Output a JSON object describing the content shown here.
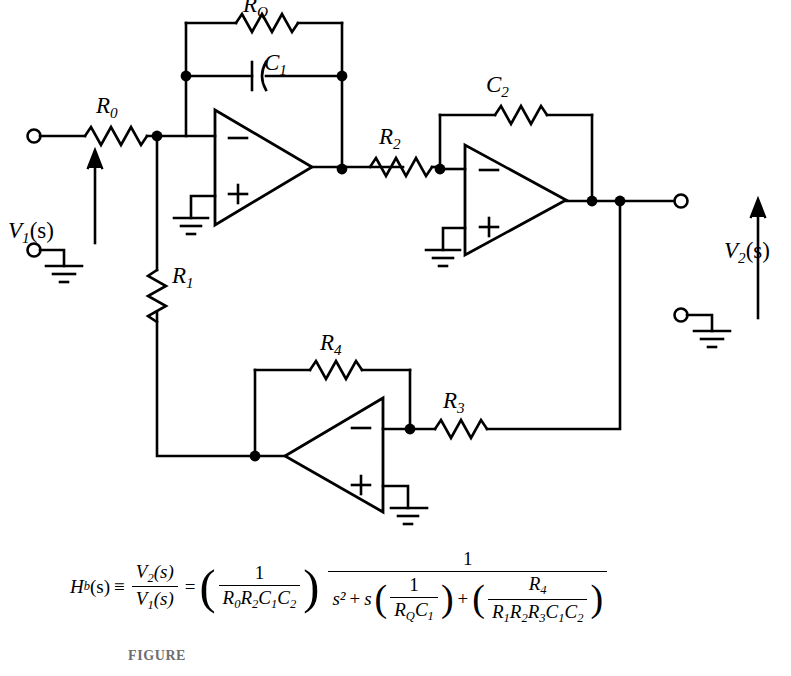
{
  "figure": {
    "type": "circuit-schematic",
    "caption": "FIGURE"
  },
  "labels": {
    "RQ": {
      "base": "R",
      "sub": "Q",
      "text": "RQ"
    },
    "C1": {
      "base": "C",
      "sub": "1",
      "text": "C1"
    },
    "R0": {
      "base": "R",
      "sub": "0",
      "text": "R0"
    },
    "R1": {
      "base": "R",
      "sub": "1",
      "text": "R1"
    },
    "R2": {
      "base": "R",
      "sub": "2",
      "text": "R2"
    },
    "R3": {
      "base": "R",
      "sub": "3",
      "text": "R3"
    },
    "R4": {
      "base": "R",
      "sub": "4",
      "text": "R4"
    },
    "C2": {
      "base": "C",
      "sub": "2",
      "text": "C2"
    },
    "V1": {
      "base": "V",
      "sub": "1",
      "arg": "(s)",
      "text": "V1(s)"
    },
    "V2": {
      "base": "V",
      "sub": "2",
      "arg": "(s)",
      "text": "V2(s)"
    }
  },
  "opamps": [
    {
      "id": "opamp-1",
      "minus": "−",
      "plus": "+",
      "orientation": "left-to-right"
    },
    {
      "id": "opamp-2",
      "minus": "−",
      "plus": "+",
      "orientation": "left-to-right"
    },
    {
      "id": "opamp-3",
      "minus": "−",
      "plus": "+",
      "orientation": "right-to-left"
    }
  ],
  "equation": {
    "lhs_fn": "H",
    "lhs_sub": "b",
    "lhs_arg": "(s)",
    "identity": "≡",
    "ratio_num": "V2(s)",
    "ratio_den": "V1(s)",
    "equals": "=",
    "gain_num": "1",
    "gain_den": "R0R2C1C2",
    "frac_num": "1",
    "den_s2": "s²",
    "den_plus1": "+",
    "den_s": "s",
    "den_term1_num": "1",
    "den_term1_den": "RQC1",
    "den_plus2": "+",
    "den_term2_num": "R4",
    "den_term2_den": "R1R2R3C1C2",
    "plain": "H_b(s) = V2(s)/V1(s) = (1/(R0 R2 C1 C2)) * 1/(s^2 + s(1/(RQ C1)) + (R4/(R1 R2 R3 C1 C2)))"
  },
  "colors": {
    "ink": "#000000",
    "paper": "#ffffff",
    "caption": "#6e6e6e"
  }
}
